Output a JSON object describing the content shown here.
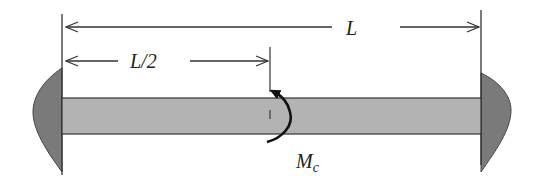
{
  "diagram": {
    "type": "fixed-fixed beam with concentrated moment",
    "labels": {
      "span": "L",
      "half_span": "L/2",
      "moment_main": "M",
      "moment_sub": "c"
    },
    "colors": {
      "beam_fill": "#b3b3b3",
      "support_fill": "#7a7a7a",
      "line": "#333333",
      "background": "#ffffff"
    }
  }
}
